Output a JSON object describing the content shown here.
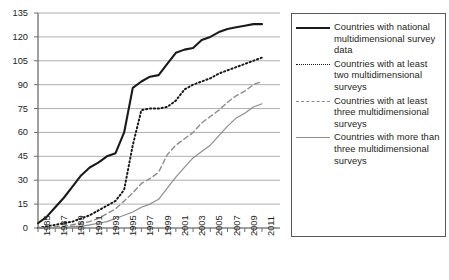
{
  "chart_data": {
    "type": "line",
    "title": "",
    "xlabel": "",
    "ylabel": "",
    "xlim": [
      1985,
      2011
    ],
    "ylim": [
      0,
      135
    ],
    "grid": true,
    "legend_position": "right",
    "y_ticks": [
      0,
      15,
      30,
      45,
      60,
      75,
      90,
      105,
      120,
      135
    ],
    "x_ticks": [
      1985,
      1987,
      1989,
      1991,
      1993,
      1995,
      1997,
      1999,
      2001,
      2003,
      2005,
      2007,
      2009,
      2011
    ],
    "x_tick_labels": [
      "1985",
      "1987",
      "1989",
      "1991",
      "1993",
      "1995",
      "1997",
      "1999",
      "2001",
      "2003",
      "2005",
      "2007",
      "2009",
      "2011"
    ],
    "x": [
      1985,
      1986,
      1987,
      1988,
      1989,
      1990,
      1991,
      1992,
      1993,
      1994,
      1995,
      1996,
      1997,
      1998,
      1999,
      2000,
      2001,
      2002,
      2003,
      2004,
      2005,
      2006,
      2007,
      2008,
      2009,
      2010,
      2011
    ],
    "series": [
      {
        "name": "Countries with national multidimensional survey data",
        "style": "solid-thick",
        "color": "#1a1a1a",
        "values": [
          3,
          7,
          13,
          19,
          26,
          33,
          38,
          41,
          45,
          47,
          60,
          88,
          92,
          95,
          96,
          103,
          110,
          112,
          113,
          118,
          120,
          123,
          125,
          126,
          127,
          128,
          128
        ]
      },
      {
        "name": "Countries with at least two multidimensional surveys",
        "style": "dotted",
        "color": "#1a1a1a",
        "values": [
          0,
          1,
          2,
          3,
          4,
          6,
          8,
          11,
          14,
          17,
          24,
          52,
          74,
          75,
          75,
          76,
          80,
          87,
          90,
          92,
          94,
          97,
          99,
          101,
          103,
          105,
          107
        ]
      },
      {
        "name": "Countries with at least three multidimensional surveys",
        "style": "dashed",
        "color": "#8c8c8c",
        "values": [
          0,
          0,
          1,
          1,
          2,
          3,
          4,
          6,
          9,
          12,
          17,
          22,
          28,
          31,
          35,
          46,
          52,
          56,
          60,
          66,
          70,
          74,
          79,
          83,
          86,
          90,
          92
        ]
      },
      {
        "name": "Countries with more than three multidimensional surveys",
        "style": "solid-thin",
        "color": "#8c8c8c",
        "values": [
          0,
          0,
          0,
          0,
          1,
          1,
          2,
          3,
          4,
          6,
          8,
          10,
          13,
          15,
          18,
          25,
          32,
          38,
          44,
          48,
          52,
          58,
          64,
          69,
          72,
          76,
          78
        ]
      }
    ]
  },
  "legend": {
    "items": [
      {
        "label": "Countries with national multidimensional survey data",
        "style": "solid-thick"
      },
      {
        "label": "Countries with at least two multidimensional surveys",
        "style": "dotted"
      },
      {
        "label": "Countries with at least three multidimensional surveys",
        "style": "dashed"
      },
      {
        "label": "Countries with more than three multidimensional surveys",
        "style": "solid-thin"
      }
    ]
  }
}
